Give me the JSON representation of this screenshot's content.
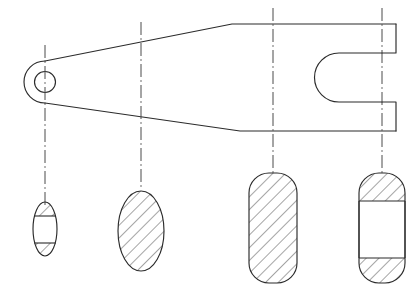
{
  "drawing": {
    "title": "Lever arm with fork end - orthographic view with four cross sections",
    "domain_note": "Monochrome 2D technical line drawing",
    "colors": {
      "background": "#ffffff",
      "outline": "#2b2b2b",
      "centerline": "#4a4a4a",
      "hatch": "#2b2b2b",
      "section_open": "#ffffff"
    },
    "canvas": {
      "width": 417,
      "height": 299
    },
    "main_view": {
      "label": "lever-side-elevation",
      "boss": {
        "label": "pivot-boss",
        "center_x": 45,
        "center_y": 82,
        "outer_radius": 21,
        "bore_radius": 10.5
      },
      "body": {
        "label": "tapered-arm",
        "top_edge_start_x": 45,
        "top_edge_start_y": 61,
        "top_edge_knee_x": 232,
        "top_edge_knee_y": 24,
        "top_edge_end_x": 396,
        "top_edge_end_y": 24,
        "bottom_edge_start_x": 45,
        "bottom_edge_start_y": 103,
        "bottom_edge_knee_x": 240,
        "bottom_edge_knee_y": 131,
        "bottom_edge_end_x": 396,
        "bottom_edge_end_y": 131
      },
      "fork": {
        "label": "fork-clevis-end",
        "slot_left_x": 339,
        "slot_top_y": 53,
        "slot_bottom_y": 102,
        "prong_right_x": 396,
        "upper_prong_inner_y": 53,
        "lower_prong_inner_y": 102,
        "step_x": 382
      }
    },
    "centerlines": [
      {
        "label": "station-A-centerline",
        "x": 45,
        "y_top": 45,
        "y_bottom": 205
      },
      {
        "label": "station-B-centerline",
        "x": 141,
        "y_top": 22,
        "y_bottom": 190
      },
      {
        "label": "station-C-centerline",
        "x": 273,
        "y_top": 8,
        "y_bottom": 175
      },
      {
        "label": "station-D-centerline",
        "x": 382,
        "y_top": 8,
        "y_bottom": 175
      }
    ],
    "sections": [
      {
        "label": "section-A-boss",
        "shape": "ellipse",
        "center_x": 45,
        "center_y": 229,
        "rx": 12,
        "ry": 27,
        "corner_radius": 0,
        "hatched": "partial",
        "open_band_top_y": 216,
        "open_band_bottom_y": 243,
        "description": "Boss section: thin elliptical wall with central bore shown unhatched"
      },
      {
        "label": "section-B-arm",
        "shape": "ellipse",
        "center_x": 141,
        "center_y": 231,
        "rx": 23,
        "ry": 40,
        "corner_radius": 0,
        "hatched": "full",
        "open_band_top_y": 0,
        "open_band_bottom_y": 0,
        "description": "Mid-arm section: solid elliptical cross-section, fully hatched"
      },
      {
        "label": "section-C-solid-block",
        "shape": "stadium",
        "center_x": 273,
        "center_y": 228,
        "rx": 24,
        "ry": 55,
        "corner_radius": 20,
        "hatched": "full",
        "open_band_top_y": 0,
        "open_band_bottom_y": 0,
        "description": "Solid rectangular block section with rounded ends, fully hatched"
      },
      {
        "label": "section-D-fork",
        "shape": "stadium",
        "center_x": 382,
        "center_y": 228,
        "rx": 23,
        "ry": 55,
        "corner_radius": 20,
        "hatched": "partial",
        "open_band_top_y": 201,
        "open_band_bottom_y": 258,
        "description": "Fork section: two prongs hatched, central slot unhatched"
      }
    ],
    "hatching": {
      "angle_degrees": 45,
      "spacing": 9,
      "stroke_width": 0.85
    }
  }
}
